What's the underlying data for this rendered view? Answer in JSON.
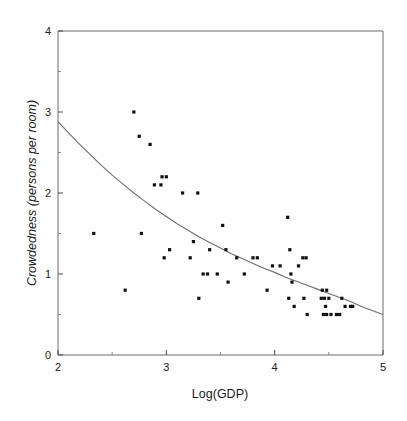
{
  "chart_data": {
    "type": "scatter",
    "title": "",
    "xlabel": "Log(GDP)",
    "ylabel": "Crowdedness (persons per room)",
    "xlim": [
      2,
      5
    ],
    "ylim": [
      0,
      4
    ],
    "x_major_ticks": [
      2,
      3,
      4,
      5
    ],
    "y_major_ticks": [
      0,
      1,
      2,
      3,
      4
    ],
    "x_minor_ticks": [
      2.5,
      3.5,
      4.5
    ],
    "y_minor_ticks": [
      0.5,
      1.5,
      2.5,
      3.5
    ],
    "grid": false,
    "legend": null,
    "point_color": "#111111",
    "curve_color": "#6e6e6e",
    "frame_color": "#6b6b6b",
    "series": [
      {
        "name": "Countries",
        "marker": "filled-square",
        "points": [
          [
            2.33,
            1.5
          ],
          [
            2.62,
            0.8
          ],
          [
            2.7,
            3.0
          ],
          [
            2.75,
            2.7
          ],
          [
            2.77,
            1.5
          ],
          [
            2.85,
            2.6
          ],
          [
            2.89,
            2.1
          ],
          [
            2.95,
            2.1
          ],
          [
            2.96,
            2.2
          ],
          [
            3.0,
            2.2
          ],
          [
            2.98,
            1.2
          ],
          [
            3.03,
            1.3
          ],
          [
            3.15,
            2.0
          ],
          [
            3.22,
            1.2
          ],
          [
            3.25,
            1.4
          ],
          [
            3.3,
            0.7
          ],
          [
            3.34,
            1.0
          ],
          [
            3.38,
            1.0
          ],
          [
            3.4,
            1.3
          ],
          [
            3.29,
            2.0
          ],
          [
            3.47,
            1.0
          ],
          [
            3.52,
            1.6
          ],
          [
            3.55,
            1.3
          ],
          [
            3.57,
            0.9
          ],
          [
            3.65,
            1.2
          ],
          [
            3.72,
            1.0
          ],
          [
            3.8,
            1.2
          ],
          [
            3.84,
            1.2
          ],
          [
            3.93,
            0.8
          ],
          [
            3.98,
            1.1
          ],
          [
            4.05,
            1.1
          ],
          [
            4.12,
            1.7
          ],
          [
            4.14,
            1.3
          ],
          [
            4.15,
            1.0
          ],
          [
            4.16,
            0.9
          ],
          [
            4.13,
            0.7
          ],
          [
            4.18,
            0.6
          ],
          [
            4.22,
            1.1
          ],
          [
            4.26,
            1.2
          ],
          [
            4.29,
            1.2
          ],
          [
            4.27,
            0.7
          ],
          [
            4.3,
            0.5
          ],
          [
            4.44,
            0.8
          ],
          [
            4.48,
            0.8
          ],
          [
            4.43,
            0.7
          ],
          [
            4.46,
            0.7
          ],
          [
            4.5,
            0.7
          ],
          [
            4.47,
            0.6
          ],
          [
            4.45,
            0.5
          ],
          [
            4.48,
            0.5
          ],
          [
            4.52,
            0.5
          ],
          [
            4.57,
            0.5
          ],
          [
            4.6,
            0.5
          ],
          [
            4.62,
            0.7
          ],
          [
            4.65,
            0.6
          ],
          [
            4.7,
            0.6
          ],
          [
            4.72,
            0.6
          ]
        ]
      }
    ],
    "fit_curve": {
      "name": "fitted-decay-curve",
      "points": [
        [
          2.0,
          2.88
        ],
        [
          2.1,
          2.74
        ],
        [
          2.2,
          2.6
        ],
        [
          2.3,
          2.47
        ],
        [
          2.4,
          2.34
        ],
        [
          2.5,
          2.22
        ],
        [
          2.6,
          2.11
        ],
        [
          2.7,
          2.0
        ],
        [
          2.8,
          1.9
        ],
        [
          2.9,
          1.8
        ],
        [
          3.0,
          1.71
        ],
        [
          3.1,
          1.62
        ],
        [
          3.2,
          1.54
        ],
        [
          3.3,
          1.46
        ],
        [
          3.4,
          1.39
        ],
        [
          3.5,
          1.32
        ],
        [
          3.6,
          1.25
        ],
        [
          3.7,
          1.19
        ],
        [
          3.8,
          1.13
        ],
        [
          3.9,
          1.07
        ],
        [
          4.0,
          1.02
        ],
        [
          4.1,
          0.96
        ],
        [
          4.2,
          0.91
        ],
        [
          4.3,
          0.86
        ],
        [
          4.4,
          0.81
        ],
        [
          4.5,
          0.76
        ],
        [
          4.6,
          0.71
        ],
        [
          4.7,
          0.66
        ],
        [
          4.8,
          0.6
        ],
        [
          4.9,
          0.55
        ],
        [
          5.0,
          0.5
        ]
      ]
    }
  },
  "axes": {
    "x_tick_labels": [
      "2",
      "3",
      "4",
      "5"
    ],
    "y_tick_labels": [
      "0",
      "1",
      "2",
      "3",
      "4"
    ],
    "x_axis_title": "Log(GDP)",
    "y_axis_title": "Crowdedness (persons per room)"
  }
}
